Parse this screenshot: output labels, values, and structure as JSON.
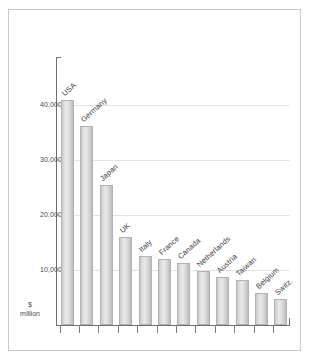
{
  "chart_data": {
    "type": "bar",
    "title": "",
    "subtitle": "",
    "xlabel": "",
    "ylabel": "$ million",
    "ylim": [
      0,
      48800
    ],
    "grid": true,
    "legend": false,
    "orientation": "vertical",
    "bar_color": "#dcdcdc",
    "categories": [
      "USA",
      "Germany",
      "Japan",
      "UK",
      "Italy",
      "France",
      "Canada",
      "Netherlands",
      "Austria",
      "Taiwan",
      "Belgium",
      "Switz."
    ],
    "values": [
      40900,
      36200,
      25500,
      16000,
      12500,
      12000,
      11300,
      9800,
      8700,
      8200,
      5900,
      4800
    ],
    "ytick_labels": [
      "10,000",
      "20,000",
      "30,000",
      "40,000"
    ],
    "ytick_values": [
      10000,
      20000,
      30000,
      40000
    ],
    "unit_label_line1": "$",
    "unit_label_line2": "million"
  },
  "axis": {
    "unit_line1": "$",
    "unit_line2": "million"
  }
}
